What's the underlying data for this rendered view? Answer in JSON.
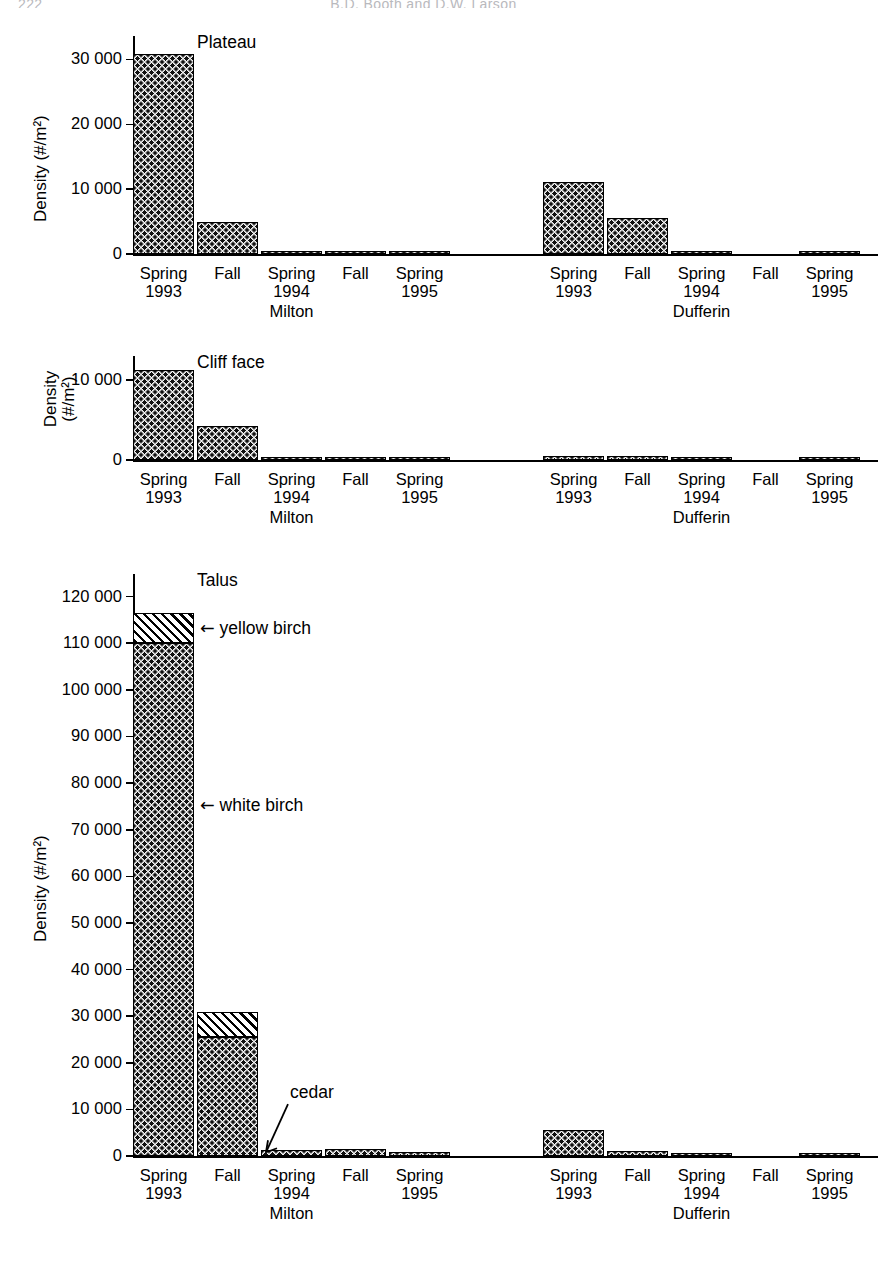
{
  "runhead": {
    "page_number": "222",
    "title": "B.D. Booth and D.W. Larson"
  },
  "axis": {
    "ylabel_full": "Density (#/m²)",
    "ylabel_line1": "Density",
    "ylabel_line2": "(#/m²)"
  },
  "categories": [
    {
      "season": "Spring",
      "year": "1993"
    },
    {
      "season": "Fall",
      "year": ""
    },
    {
      "season": "Spring",
      "year": "1994"
    },
    {
      "season": "Fall",
      "year": ""
    },
    {
      "season": "Spring",
      "year": "1995"
    }
  ],
  "sites": [
    {
      "name": "Milton"
    },
    {
      "name": "Dufferin"
    }
  ],
  "series_labels": {
    "white_birch": "white birch",
    "yellow_birch": "yellow birch",
    "cedar": "cedar",
    "arrow_glyph": "←"
  },
  "panels": [
    {
      "id": "plateau",
      "title": "Plateau",
      "ylabel_mode": "single",
      "ymax": 33000,
      "yticks": [
        0,
        10000,
        20000,
        30000
      ],
      "yticklabels": [
        "0",
        "10 000",
        "20 000",
        "30 000"
      ]
    },
    {
      "id": "cliff",
      "title": "Cliff face",
      "ylabel_mode": "two-line",
      "ymax": 12500,
      "yticks": [
        0,
        10000
      ],
      "yticklabels": [
        "0",
        "10 000"
      ]
    },
    {
      "id": "talus",
      "title": "Talus",
      "ylabel_mode": "single",
      "ymax": 124000,
      "yticks": [
        0,
        10000,
        20000,
        30000,
        40000,
        50000,
        60000,
        70000,
        80000,
        90000,
        100000,
        110000,
        120000
      ],
      "yticklabels": [
        "0",
        "10 000",
        "20 000",
        "30 000",
        "40 000",
        "50 000",
        "60 000",
        "70 000",
        "80 000",
        "90 000",
        "100 000",
        "110 000",
        "120 000"
      ]
    }
  ],
  "chart_data": {
    "type": "bar",
    "xlabel": "",
    "ylabel": "Density (#/m²)",
    "stacked": true,
    "grid": false,
    "legend": "annotations",
    "categories": [
      "Spring 1993",
      "Fall 1993",
      "Spring 1994",
      "Fall 1994",
      "Spring 1995"
    ],
    "sites": [
      "Milton",
      "Dufferin"
    ],
    "series": [
      "white birch",
      "yellow birch"
    ],
    "panels": [
      {
        "name": "Plateau",
        "ylim": [
          0,
          33000
        ],
        "yticks": [
          0,
          10000,
          20000,
          30000
        ],
        "data": {
          "Milton": {
            "white birch": [
              30800,
              5000,
              350,
              300,
              350
            ],
            "yellow birch": [
              0,
              0,
              0,
              0,
              0
            ]
          },
          "Dufferin": {
            "white birch": [
              11100,
              5500,
              150,
              0,
              150
            ],
            "yellow birch": [
              0,
              0,
              0,
              0,
              0
            ]
          }
        }
      },
      {
        "name": "Cliff face",
        "ylim": [
          0,
          12500
        ],
        "yticks": [
          0,
          10000
        ],
        "data": {
          "Milton": {
            "white birch": [
              11200,
              4200,
              250,
              250,
              250
            ],
            "yellow birch": [
              0,
              0,
              0,
              0,
              0
            ]
          },
          "Dufferin": {
            "white birch": [
              500,
              550,
              60,
              0,
              200
            ],
            "yellow birch": [
              0,
              0,
              0,
              0,
              0
            ]
          }
        }
      },
      {
        "name": "Talus",
        "ylim": [
          0,
          124000
        ],
        "yticks": [
          0,
          10000,
          20000,
          30000,
          40000,
          50000,
          60000,
          70000,
          80000,
          90000,
          100000,
          110000,
          120000
        ],
        "data": {
          "Milton": {
            "white birch": [
              110000,
              25500,
              1200,
              1500,
              900
            ],
            "yellow birch": [
              6500,
              5500,
              0,
              0,
              0
            ]
          },
          "Dufferin": {
            "white birch": [
              5500,
              1100,
              150,
              0,
              100
            ],
            "yellow birch": [
              0,
              0,
              0,
              0,
              0
            ]
          }
        }
      }
    ],
    "annotations": [
      {
        "text": "yellow birch",
        "panel": "Talus",
        "points_to": "Spring 1993 Milton upper segment"
      },
      {
        "text": "white birch",
        "panel": "Talus",
        "points_to": "Spring 1993 Milton lower segment"
      },
      {
        "text": "cedar",
        "panel": "Talus",
        "points_to": "Spring 1994 Milton bar"
      }
    ]
  }
}
